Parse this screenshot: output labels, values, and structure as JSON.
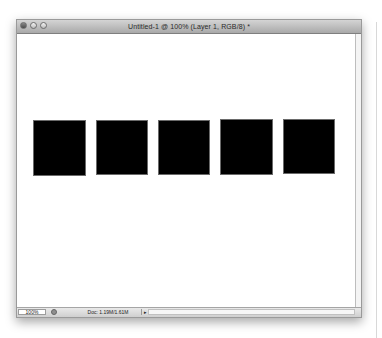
{
  "window": {
    "title": "Untitled-1 @ 100% (Layer 1, RGB/8) *",
    "controls": [
      "close-button",
      "minimize-button",
      "zoom-button"
    ]
  },
  "canvas": {
    "background": "#ffffff",
    "shapes": [
      {
        "name": "square-1",
        "x": 16,
        "y": 86,
        "w": 53,
        "h": 56,
        "color": "#000000"
      },
      {
        "name": "square-2",
        "x": 79,
        "y": 86,
        "w": 52,
        "h": 55,
        "color": "#000000"
      },
      {
        "name": "square-3",
        "x": 141,
        "y": 86,
        "w": 52,
        "h": 55,
        "color": "#000000"
      },
      {
        "name": "square-4",
        "x": 203,
        "y": 85,
        "w": 53,
        "h": 56,
        "color": "#000000"
      },
      {
        "name": "square-5",
        "x": 266,
        "y": 85,
        "w": 52,
        "h": 55,
        "color": "#000000"
      }
    ]
  },
  "statusbar": {
    "zoom": "100%",
    "doc_info": "Doc: 1.19M/1.61M",
    "arrow": "▸"
  }
}
